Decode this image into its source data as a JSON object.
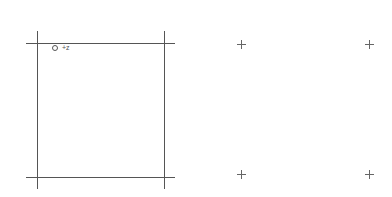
{
  "diagram": {
    "frame": {
      "top_line": {
        "x1": 26,
        "x2": 175,
        "y": 43
      },
      "bottom_line": {
        "x1": 26,
        "x2": 175,
        "y": 177
      },
      "left_line": {
        "x": 37,
        "y1": 31,
        "y2": 189
      },
      "right_line": {
        "x": 164,
        "y1": 31,
        "y2": 189
      }
    },
    "origin_marker": {
      "x": 55,
      "y": 48,
      "label": "+z"
    },
    "crosshairs": [
      {
        "x": 241,
        "y": 44
      },
      {
        "x": 369,
        "y": 44
      },
      {
        "x": 241,
        "y": 174
      },
      {
        "x": 369,
        "y": 174
      }
    ],
    "colors": {
      "line": "#555555",
      "background": "#ffffff"
    }
  }
}
